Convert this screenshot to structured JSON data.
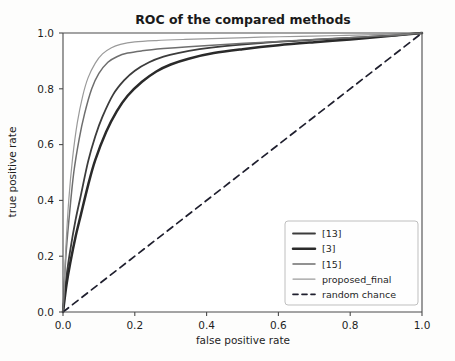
{
  "chart_data": {
    "type": "line",
    "title": "ROC of the compared methods",
    "xlabel": "false positive rate",
    "ylabel": "true positive rate",
    "xlim": [
      0.0,
      1.0
    ],
    "ylim": [
      0.0,
      1.0
    ],
    "xticks": [
      "0.0",
      "0.2",
      "0.4",
      "0.6",
      "0.8",
      "1.0"
    ],
    "yticks": [
      "0.0",
      "0.2",
      "0.4",
      "0.6",
      "0.8",
      "1.0"
    ],
    "xtick_values": [
      0.0,
      0.2,
      0.4,
      0.6,
      0.8,
      1.0
    ],
    "ytick_values": [
      0.0,
      0.2,
      0.4,
      0.6,
      0.8,
      1.0
    ],
    "grid": false,
    "legend_position": "lower right",
    "series": [
      {
        "name": "[13]",
        "color": "#3c3c3c",
        "width": 1.8,
        "dash": "none",
        "x": [
          0.0,
          0.01,
          0.02,
          0.035,
          0.05,
          0.07,
          0.09,
          0.11,
          0.14,
          0.17,
          0.2,
          0.24,
          0.28,
          0.32,
          0.38,
          0.45,
          0.55,
          0.65,
          0.75,
          0.85,
          0.93,
          1.0
        ],
        "y": [
          0.0,
          0.13,
          0.22,
          0.33,
          0.42,
          0.54,
          0.63,
          0.7,
          0.78,
          0.83,
          0.865,
          0.895,
          0.915,
          0.928,
          0.942,
          0.953,
          0.964,
          0.972,
          0.979,
          0.986,
          0.992,
          1.0
        ]
      },
      {
        "name": "[3]",
        "color": "#2a2a2a",
        "width": 2.5,
        "dash": "none",
        "x": [
          0.0,
          0.01,
          0.02,
          0.035,
          0.05,
          0.07,
          0.09,
          0.12,
          0.15,
          0.18,
          0.22,
          0.26,
          0.3,
          0.35,
          0.42,
          0.5,
          0.6,
          0.7,
          0.8,
          0.9,
          1.0
        ],
        "y": [
          0.0,
          0.1,
          0.175,
          0.27,
          0.35,
          0.455,
          0.545,
          0.645,
          0.72,
          0.775,
          0.825,
          0.862,
          0.887,
          0.908,
          0.928,
          0.942,
          0.956,
          0.967,
          0.977,
          0.988,
          1.0
        ]
      },
      {
        "name": "[15]",
        "color": "#6e6e6e",
        "width": 1.5,
        "dash": "none",
        "x": [
          0.0,
          0.008,
          0.018,
          0.03,
          0.045,
          0.06,
          0.08,
          0.1,
          0.125,
          0.15,
          0.18,
          0.22,
          0.28,
          0.35,
          0.45,
          0.55,
          0.65,
          0.75,
          0.85,
          0.93,
          1.0
        ],
        "y": [
          0.0,
          0.2,
          0.35,
          0.5,
          0.62,
          0.71,
          0.8,
          0.855,
          0.895,
          0.915,
          0.928,
          0.936,
          0.944,
          0.951,
          0.959,
          0.966,
          0.973,
          0.98,
          0.987,
          0.992,
          1.0
        ]
      },
      {
        "name": "proposed_final",
        "color": "#9a9a9a",
        "width": 1.2,
        "dash": "none",
        "x": [
          0.0,
          0.008,
          0.016,
          0.027,
          0.04,
          0.055,
          0.07,
          0.09,
          0.11,
          0.135,
          0.16,
          0.2,
          0.26,
          0.34,
          0.44,
          0.55,
          0.66,
          0.77,
          0.87,
          0.94,
          1.0
        ],
        "y": [
          0.0,
          0.23,
          0.4,
          0.555,
          0.68,
          0.775,
          0.84,
          0.892,
          0.925,
          0.947,
          0.959,
          0.968,
          0.973,
          0.977,
          0.981,
          0.985,
          0.988,
          0.991,
          0.994,
          0.997,
          1.0
        ]
      },
      {
        "name": "random chance",
        "color": "#1f1f2e",
        "width": 1.7,
        "dash": "7,5",
        "x": [
          0.0,
          1.0
        ],
        "y": [
          0.0,
          1.0
        ]
      }
    ]
  },
  "legend": {
    "entries": [
      {
        "label": "[13]"
      },
      {
        "label": "[3]"
      },
      {
        "label": "[15]"
      },
      {
        "label": "proposed_final"
      },
      {
        "label": "random chance"
      }
    ]
  }
}
